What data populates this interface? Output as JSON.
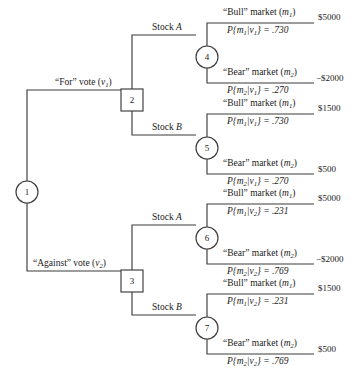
{
  "diagram": {
    "type": "decision-tree",
    "line_color": "#3b3b3b",
    "text_color": "#1a1a1a",
    "nodes": [
      {
        "id": "1",
        "label": "1",
        "shape": "circle",
        "kind": "decision-start",
        "x": 27,
        "y": 192
      },
      {
        "id": "2",
        "label": "2",
        "shape": "square",
        "kind": "decision",
        "x": 132,
        "y": 100
      },
      {
        "id": "3",
        "label": "3",
        "shape": "square",
        "kind": "decision",
        "x": 132,
        "y": 281
      },
      {
        "id": "4",
        "label": "4",
        "shape": "circle",
        "kind": "chance",
        "x": 207,
        "y": 57
      },
      {
        "id": "5",
        "label": "5",
        "shape": "circle",
        "kind": "chance",
        "x": 207,
        "y": 148
      },
      {
        "id": "6",
        "label": "6",
        "shape": "circle",
        "kind": "chance",
        "x": 207,
        "y": 238
      },
      {
        "id": "7",
        "label": "7",
        "shape": "circle",
        "kind": "chance",
        "x": 207,
        "y": 328
      }
    ],
    "vote_branches": [
      {
        "id": "for-vote",
        "text_plain": "“For” vote (v1)",
        "prefix": "“For” vote (",
        "var": "v",
        "sub": "1",
        "suffix": ")",
        "x": 55,
        "y": 90
      },
      {
        "id": "against-vote",
        "text_plain": "“Against” vote (v2)",
        "prefix": "“Against” vote (",
        "var": "v",
        "sub": "2",
        "suffix": ")",
        "x": 33,
        "y": 271
      }
    ],
    "stock_branches": [
      {
        "id": "stock-a-top",
        "prefix": "Stock ",
        "var": "A",
        "x": 152,
        "y": 35
      },
      {
        "id": "stock-b-top",
        "prefix": "Stock ",
        "var": "B",
        "x": 152,
        "y": 135
      },
      {
        "id": "stock-a-bottom",
        "prefix": "Stock ",
        "var": "A",
        "x": 152,
        "y": 225
      },
      {
        "id": "stock-b-bottom",
        "prefix": "Stock ",
        "var": "B",
        "x": 152,
        "y": 315
      }
    ],
    "outcomes": [
      {
        "id": "n4-bull",
        "parent": "4",
        "market_prefix": "“Bull” market (",
        "market_var": "m",
        "market_sub": "1",
        "market_suffix": ")",
        "prob_text": "P{m1|v1} = .730",
        "p_event": "m",
        "p_event_sub": "1",
        "p_given": "v",
        "p_given_sub": "1",
        "p_value": ".730",
        "payoff": "$5000",
        "negative": false,
        "label_x": 223,
        "label_y": 8,
        "rule_x": 219,
        "rule_y": 23,
        "rule_w": 95,
        "payoff_x": 318,
        "payoff_y": 13
      },
      {
        "id": "n4-bear",
        "parent": "4",
        "market_prefix": "“Bear” market (",
        "market_var": "m",
        "market_sub": "2",
        "market_suffix": ")",
        "prob_text": "P{m2|v1} = .270",
        "p_event": "m",
        "p_event_sub": "2",
        "p_given": "v",
        "p_given_sub": "1",
        "p_value": ".270",
        "payoff": "−$2000",
        "negative": true,
        "label_x": 223,
        "label_y": 68,
        "rule_x": 219,
        "rule_y": 83,
        "rule_w": 95,
        "payoff_x": 316,
        "payoff_y": 74
      },
      {
        "id": "n5-bull",
        "parent": "5",
        "market_prefix": "“Bull” market (",
        "market_var": "m",
        "market_sub": "1",
        "market_suffix": ")",
        "prob_text": "P{m1|v1} = .730",
        "p_event": "m",
        "p_event_sub": "1",
        "p_given": "v",
        "p_given_sub": "1",
        "p_value": ".730",
        "payoff": "$1500",
        "negative": false,
        "label_x": 223,
        "label_y": 99,
        "rule_x": 219,
        "rule_y": 114,
        "rule_w": 95,
        "payoff_x": 318,
        "payoff_y": 104
      },
      {
        "id": "n5-bear",
        "parent": "5",
        "market_prefix": "“Bear” market (",
        "market_var": "m",
        "market_sub": "2",
        "market_suffix": ")",
        "prob_text": "P{m2|v1} = .270",
        "p_event": "m",
        "p_event_sub": "2",
        "p_given": "v",
        "p_given_sub": "1",
        "p_value": ".270",
        "payoff": "$500",
        "negative": false,
        "label_x": 223,
        "label_y": 159,
        "rule_x": 219,
        "rule_y": 174,
        "rule_w": 95,
        "payoff_x": 318,
        "payoff_y": 165
      },
      {
        "id": "n6-bull",
        "parent": "6",
        "market_prefix": "“Bull” market (",
        "market_var": "m",
        "market_sub": "1",
        "market_suffix": ")",
        "prob_text": "P{m1|v2} = .231",
        "p_event": "m",
        "p_event_sub": "1",
        "p_given": "v",
        "p_given_sub": "2",
        "p_value": ".231",
        "payoff": "$5000",
        "negative": false,
        "label_x": 223,
        "label_y": 189,
        "rule_x": 219,
        "rule_y": 204,
        "rule_w": 95,
        "payoff_x": 318,
        "payoff_y": 194
      },
      {
        "id": "n6-bear",
        "parent": "6",
        "market_prefix": "“Bear” market (",
        "market_var": "m",
        "market_sub": "2",
        "market_suffix": ")",
        "prob_text": "P{m2|v2} = .769",
        "p_event": "m",
        "p_event_sub": "2",
        "p_given": "v",
        "p_given_sub": "2",
        "p_value": ".769",
        "payoff": "−$2000",
        "negative": true,
        "label_x": 223,
        "label_y": 249,
        "rule_x": 219,
        "rule_y": 264,
        "rule_w": 95,
        "payoff_x": 316,
        "payoff_y": 255
      },
      {
        "id": "n7-bull",
        "parent": "7",
        "market_prefix": "“Bull” market (",
        "market_var": "m",
        "market_sub": "1",
        "market_suffix": ")",
        "prob_text": "P{m1|v2} = .231",
        "p_event": "m",
        "p_event_sub": "1",
        "p_given": "v",
        "p_given_sub": "2",
        "p_value": ".231",
        "payoff": "$1500",
        "negative": false,
        "label_x": 223,
        "label_y": 279,
        "rule_x": 219,
        "rule_y": 294,
        "rule_w": 95,
        "payoff_x": 318,
        "payoff_y": 284
      },
      {
        "id": "n7-bear",
        "parent": "7",
        "market_prefix": "“Bear” market (",
        "market_var": "m",
        "market_sub": "2",
        "market_suffix": ")",
        "prob_text": "P{m2|v2} = .769",
        "p_event": "m",
        "p_event_sub": "2",
        "p_given": "v",
        "p_given_sub": "2",
        "p_value": ".769",
        "payoff": "$500",
        "negative": false,
        "label_x": 223,
        "label_y": 339,
        "rule_x": 219,
        "rule_y": 354,
        "rule_w": 95,
        "payoff_x": 318,
        "payoff_y": 345
      }
    ]
  }
}
